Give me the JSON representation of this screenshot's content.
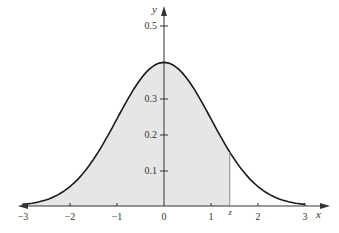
{
  "chart_data": {
    "type": "area",
    "title": "",
    "xlabel": "x",
    "ylabel": "y",
    "function": "standard_normal_pdf",
    "xlim": [
      -3,
      3
    ],
    "ylim": [
      0,
      0.5
    ],
    "x_ticks": [
      "-3",
      "-2",
      "-1",
      "0",
      "1",
      "z",
      "2",
      "3"
    ],
    "y_ticks": [
      "0.1",
      "0.2",
      "0.3",
      "0.5"
    ],
    "shaded_region": {
      "from": "-inf",
      "to": "z",
      "z_value": 1.4
    },
    "peak": {
      "x": 0,
      "y": 0.399
    },
    "grid": false,
    "legend": null
  },
  "labels": {
    "x_axis": "x",
    "y_axis": "y",
    "z_marker": "z",
    "xt_m3": "−3",
    "xt_m2": "−2",
    "xt_m1": "−1",
    "xt_0": "0",
    "xt_1": "1",
    "xt_2": "2",
    "xt_3": "3",
    "yt_01": "0.1",
    "yt_02": "0.2",
    "yt_03": "0.3",
    "yt_05": "0.5"
  },
  "colors": {
    "shade": "#e6e6e6",
    "curve": "#1a1a1a",
    "axis": "#333333"
  }
}
